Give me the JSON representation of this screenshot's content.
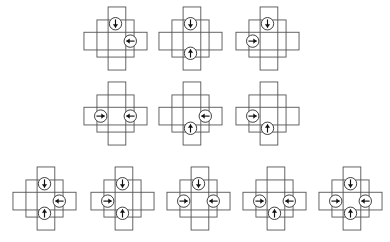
{
  "page": {
    "background_color": "#ffffff",
    "width": 390,
    "height": 242,
    "clipped_caption_text": "py                    y"
  },
  "style": {
    "stroke_color": "#545454",
    "stroke_color_dark": "#2b2b2b",
    "arrow_color": "#111111",
    "circle_fill": "#ffffff",
    "stroke_width": 0.9,
    "circle_radius": 6.2,
    "cell": 14.5
  },
  "glossary": {
    "shape_name": "plus-cross",
    "component_vertical_bar": "vertical-rectangle",
    "component_horizontal_bar": "horizontal-rectangle",
    "component_center": "center-square",
    "marker_name": "arrow-circle",
    "arrow_meaning": "arrow points inward toward the center of the cross"
  },
  "rows": [
    {
      "row_label": "row-1",
      "y": 38,
      "figure_count": 3,
      "arrows_per_figure": 2,
      "figures": [
        {
          "id": "r1f1",
          "x": 115,
          "arrows": [
            "top",
            "right"
          ],
          "arrow_dirs": [
            "down",
            "left"
          ]
        },
        {
          "id": "r1f2",
          "x": 190,
          "arrows": [
            "top",
            "bottom"
          ],
          "arrow_dirs": [
            "down",
            "up"
          ]
        },
        {
          "id": "r1f3",
          "x": 267,
          "arrows": [
            "top",
            "left"
          ],
          "arrow_dirs": [
            "down",
            "right"
          ]
        }
      ]
    },
    {
      "row_label": "row-2",
      "y": 113,
      "figure_count": 3,
      "arrows_per_figure": 2,
      "figures": [
        {
          "id": "r2f1",
          "x": 115,
          "arrows": [
            "left",
            "right"
          ],
          "arrow_dirs": [
            "right",
            "left"
          ]
        },
        {
          "id": "r2f2",
          "x": 190,
          "arrows": [
            "right",
            "bottom"
          ],
          "arrow_dirs": [
            "left",
            "up"
          ]
        },
        {
          "id": "r2f3",
          "x": 267,
          "arrows": [
            "left",
            "bottom"
          ],
          "arrow_dirs": [
            "right",
            "up"
          ]
        }
      ]
    },
    {
      "row_label": "row-3",
      "y": 198,
      "figure_count": 5,
      "arrows_per_figure": "3-4",
      "figures": [
        {
          "id": "r3f1",
          "x": 44,
          "arrows": [
            "top",
            "right",
            "bottom"
          ],
          "arrow_dirs": [
            "down",
            "left",
            "up"
          ]
        },
        {
          "id": "r3f2",
          "x": 122,
          "arrows": [
            "top",
            "left",
            "bottom"
          ],
          "arrow_dirs": [
            "down",
            "right",
            "up"
          ]
        },
        {
          "id": "r3f3",
          "x": 198,
          "arrows": [
            "top",
            "left",
            "right"
          ],
          "arrow_dirs": [
            "down",
            "right",
            "left"
          ]
        },
        {
          "id": "r3f4",
          "x": 274,
          "arrows": [
            "left",
            "right",
            "bottom"
          ],
          "arrow_dirs": [
            "right",
            "left",
            "up"
          ]
        },
        {
          "id": "r3f5",
          "x": 350,
          "arrows": [
            "top",
            "left",
            "right",
            "bottom"
          ],
          "arrow_dirs": [
            "down",
            "right",
            "left",
            "up"
          ]
        }
      ]
    }
  ]
}
